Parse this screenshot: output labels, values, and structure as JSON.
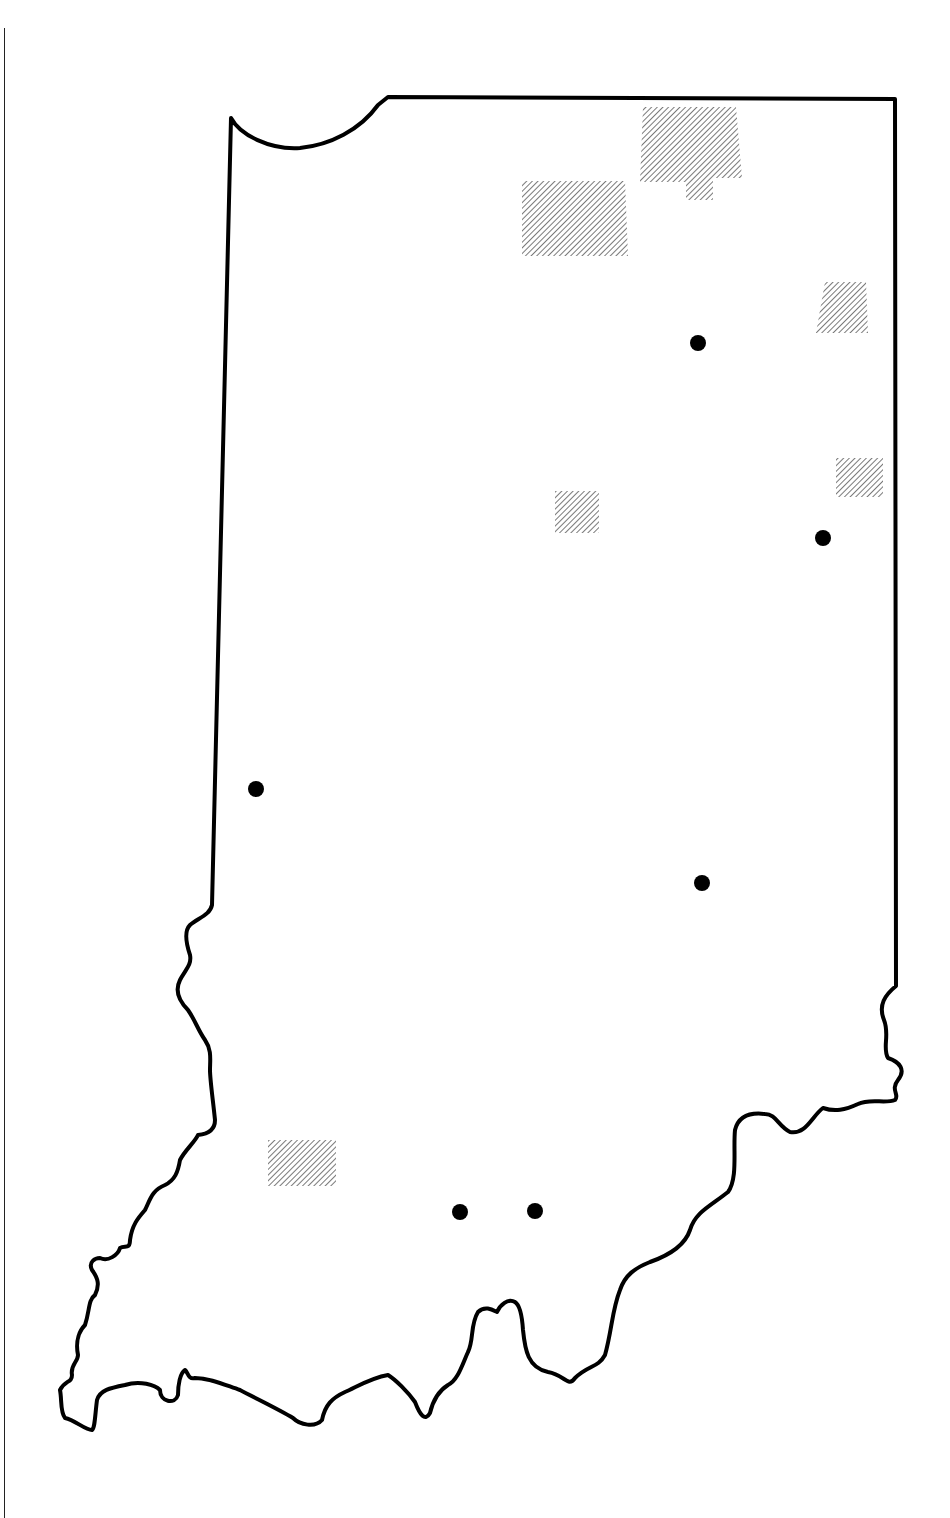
{
  "map": {
    "region": "Indiana",
    "outline_color": "#000000",
    "hatch_color": "#7a7a7a",
    "dot_color": "#000000",
    "hatched_areas": [
      {
        "name": "hatched-area-north-1",
        "points": "643,107 736,107 742,178 713,178 713,200 686,200 686,182 640,182"
      },
      {
        "name": "hatched-area-north-2",
        "points": "522,181 625,181 628,256 522,256"
      },
      {
        "name": "hatched-area-northeast-1",
        "points": "825,282 866,282 868,333 816,333"
      },
      {
        "name": "hatched-area-east-1",
        "points": "836,458 883,458 883,497 836,497"
      },
      {
        "name": "hatched-area-central-1",
        "points": "555,491 599,491 599,533 555,533"
      },
      {
        "name": "hatched-area-southwest-1",
        "points": "268,1140 336,1140 336,1186 268,1186"
      }
    ],
    "dots": [
      {
        "name": "dot-northeast",
        "cx": 698,
        "cy": 343
      },
      {
        "name": "dot-east",
        "cx": 823,
        "cy": 538
      },
      {
        "name": "dot-west",
        "cx": 256,
        "cy": 789
      },
      {
        "name": "dot-central-east",
        "cx": 702,
        "cy": 883
      },
      {
        "name": "dot-south-1",
        "cx": 460,
        "cy": 1212
      },
      {
        "name": "dot-south-2",
        "cx": 535,
        "cy": 1211
      }
    ]
  }
}
